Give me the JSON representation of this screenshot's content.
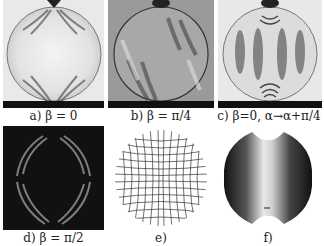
{
  "figure": {
    "panels": [
      {
        "id": "a",
        "caption": "a) β = 0",
        "type": "photoelastic-fringe-photo",
        "background": "light"
      },
      {
        "id": "b",
        "caption": "b) β = π/4",
        "type": "photoelastic-fringe-photo",
        "background": "gray"
      },
      {
        "id": "c",
        "caption": "c) β=0,  α→α+π/4",
        "type": "photoelastic-fringe-photo",
        "background": "light"
      },
      {
        "id": "d",
        "caption": "d) β = π/2",
        "type": "photoelastic-fringe-photo",
        "background": "dark"
      },
      {
        "id": "e",
        "caption": "e)",
        "type": "isostatic-line-grid"
      },
      {
        "id": "f",
        "caption": "f)",
        "type": "intensity-map-disk"
      }
    ]
  }
}
